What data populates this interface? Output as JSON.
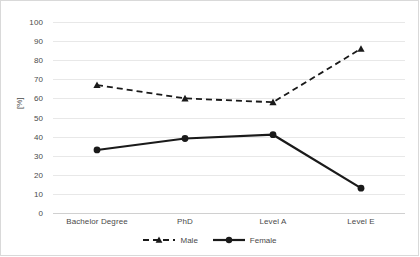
{
  "chart_data": {
    "type": "line",
    "title": "",
    "xlabel": "",
    "ylabel": "[%]",
    "categories": [
      "Bachelor Degree",
      "PhD",
      "Level A",
      "Level E"
    ],
    "ylim": [
      0,
      100
    ],
    "ytick_step": 10,
    "yticks": [
      "100",
      "90",
      "80",
      "70",
      "60",
      "50",
      "40",
      "30",
      "20",
      "10",
      "0"
    ],
    "grid": true,
    "legend_position": "bottom-center",
    "series": [
      {
        "name": "Male",
        "values": [
          67,
          60,
          58,
          86
        ],
        "style": "dashed",
        "marker": "triangle",
        "color": "#1a1a1a"
      },
      {
        "name": "Female",
        "values": [
          33,
          39,
          41,
          13
        ],
        "style": "solid",
        "marker": "circle",
        "color": "#1a1a1a"
      }
    ]
  },
  "colors": {
    "border": "#d9d9d9",
    "gridline": "#e8e8e8",
    "text": "#4a4a4a",
    "series": "#1a1a1a"
  },
  "legend": {
    "items": [
      {
        "label": "Male",
        "marker": "triangle-icon",
        "style": "dashed"
      },
      {
        "label": "Female",
        "marker": "circle-icon",
        "style": "solid"
      }
    ]
  }
}
